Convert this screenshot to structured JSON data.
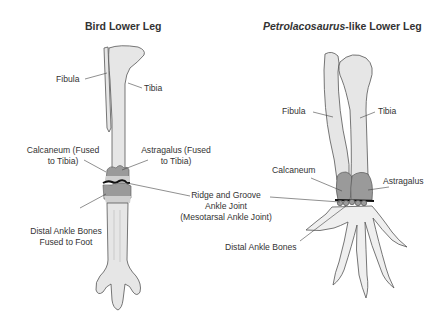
{
  "bird_panel": {
    "title": "Bird Lower Leg",
    "labels": {
      "fibula": "Fibula",
      "tibia": "Tibia",
      "calcaneum_line1": "Calcaneum (Fused",
      "calcaneum_line2": "to Tibia)",
      "astragalus_line1": "Astragalus (Fused",
      "astragalus_line2": "to Tibia)",
      "distal_line1": "Distal Ankle Bones",
      "distal_line2": "Fused to Foot"
    }
  },
  "shared_label": {
    "line1": "Ridge and Groove",
    "line2": "Ankle Joint",
    "line3": "(Mesotarsal Ankle Joint)"
  },
  "petrolacosaurus_panel": {
    "title_italic": "Petrolacosaurus",
    "title_rest": "-like Lower Leg",
    "labels": {
      "fibula": "Fibula",
      "tibia": "Tibia",
      "calcaneum": "Calcaneum",
      "astragalus": "Astragalus",
      "distal": "Distal Ankle Bones"
    }
  },
  "colors": {
    "bone_fill": "#e6e6e6",
    "ankle_fill": "#9a9a9a",
    "outline": "#555555",
    "joint_line": "#111111",
    "text": "#333333"
  }
}
